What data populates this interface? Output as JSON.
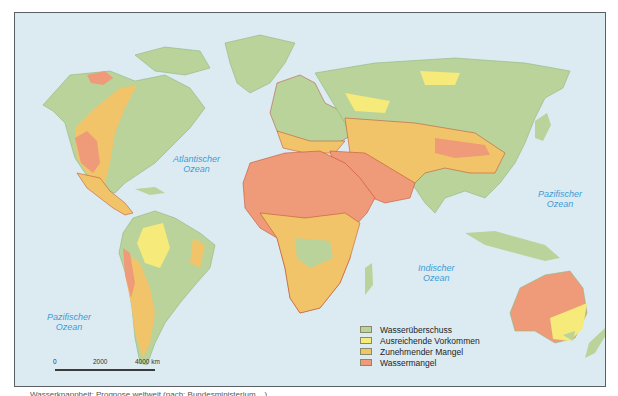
{
  "map": {
    "ocean_labels": {
      "atlantic": [
        "Atlantischer",
        "Ozean"
      ],
      "indian": [
        "Indischer",
        "Ozean"
      ],
      "pacific_east": [
        "Pazifischer",
        "Ozean"
      ],
      "pacific_west": [
        "Pazifischer",
        "Ozean"
      ]
    },
    "legend": [
      {
        "label": "Wasserüberschuss",
        "color": "#b9d39a"
      },
      {
        "label": "Ausreichende Vorkommen",
        "color": "#f5ea7a"
      },
      {
        "label": "Zunehmender Mangel",
        "color": "#f2c46a"
      },
      {
        "label": "Wassermangel",
        "color": "#ef9a78"
      }
    ],
    "scale": {
      "ticks": [
        "0",
        "2000",
        "4000 km"
      ]
    },
    "colors": {
      "ocean": "#dcebf2",
      "surplus": "#b9d39a",
      "sufficient": "#f5ea7a",
      "increasing_shortage": "#f2c46a",
      "shortage": "#ef9a78",
      "borders": "#b8452c"
    },
    "caption": "Wasserknappheit: Prognose weltweit (nach: Bundesministerium ...)"
  }
}
